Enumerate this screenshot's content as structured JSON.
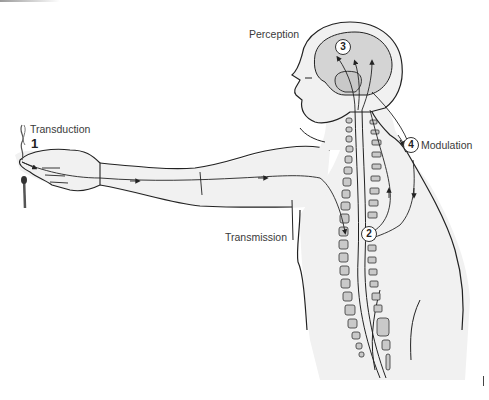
{
  "figure": {
    "stages": [
      {
        "number": "1",
        "label": "Transduction",
        "style": "plain"
      },
      {
        "number": "2",
        "label": "Transmission",
        "style": "circled"
      },
      {
        "number": "3",
        "label": "Perception",
        "style": "circled"
      },
      {
        "number": "4",
        "label": "Modulation",
        "style": "circled"
      }
    ],
    "colors": {
      "skin_fill": "#f1f1f1",
      "brain_fill": "#d4d4d4",
      "outline": "#222222",
      "vertebra_fill": "#c9c9c9"
    }
  }
}
